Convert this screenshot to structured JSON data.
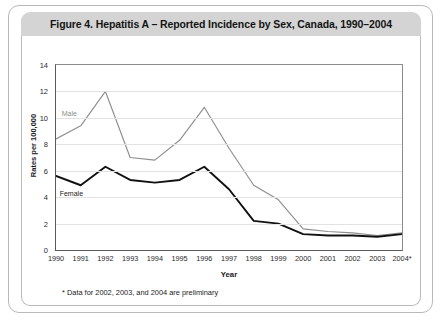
{
  "figure": {
    "title": "Figure 4. Hepatitis A – Reported Incidence by Sex, Canada, 1990–2004",
    "footnote": "* Data for 2002, 2003, and 2004 are preliminary"
  },
  "colors": {
    "male_line": "#8e8e8e",
    "female_line": "#111111",
    "gridline": "#e2e2e2",
    "axis": "#5a5a5a",
    "title_bar": "#d4d4d4",
    "card_border": "#b9b9b9",
    "panel_background": "#ffffff"
  },
  "chart_data": {
    "type": "line",
    "title": "Figure 4. Hepatitis A – Reported Incidence by Sex, Canada, 1990–2004",
    "xlabel": "Year",
    "ylabel": "Rates per 100,000",
    "categories": [
      "1990",
      "1991",
      "1992",
      "1993",
      "1994",
      "1995",
      "1996",
      "1997",
      "1998",
      "1999",
      "2000",
      "2001",
      "2002",
      "2003",
      "2004*"
    ],
    "x_tick_labels": [
      "1990",
      "1991",
      "1992",
      "1993",
      "1994",
      "1995",
      "1996",
      "1997",
      "1998",
      "1999",
      "2000",
      "2001",
      "2002",
      "2003",
      "2004*"
    ],
    "y_tick_labels": [
      "0",
      "2",
      "4",
      "6",
      "8",
      "10",
      "12",
      "14"
    ],
    "y_tick_values": [
      0,
      2,
      4,
      6,
      8,
      10,
      12,
      14
    ],
    "ylim": [
      0,
      14
    ],
    "xlim": [
      1990,
      2004
    ],
    "grid": "horizontal",
    "legend_position": "inline-labels",
    "series": [
      {
        "name": "Male",
        "color": "#8e8e8e",
        "label_year": "1991",
        "values": [
          8.4,
          9.4,
          12.0,
          7.0,
          6.8,
          8.3,
          10.8,
          7.7,
          4.9,
          3.8,
          1.6,
          1.4,
          1.3,
          1.1,
          1.3
        ]
      },
      {
        "name": "Female",
        "color": "#111111",
        "label_year": "1991",
        "values": [
          5.6,
          4.9,
          6.3,
          5.3,
          5.1,
          5.3,
          6.3,
          4.6,
          2.2,
          2.0,
          1.2,
          1.1,
          1.1,
          1.0,
          1.2
        ]
      }
    ],
    "annotations": [
      {
        "text": "Male",
        "series": "Male"
      },
      {
        "text": "Female",
        "series": "Female"
      }
    ]
  }
}
